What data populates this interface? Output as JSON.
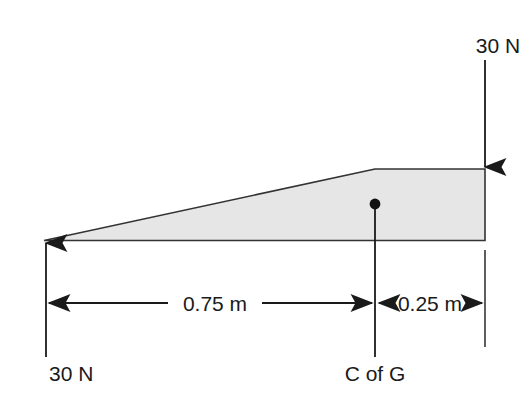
{
  "diagram": {
    "type": "free-body-diagram",
    "background_color": "#ffffff",
    "line_color": "#333333",
    "body": {
      "name": "tapered-wedge-beam",
      "fill_color": "#e6e6e6",
      "stroke_color": "#333333",
      "profile_points": "44,240 375,169 485,169 485,240"
    },
    "forces": [
      {
        "id": "left-force",
        "label": "30 N",
        "magnitude": 30,
        "unit": "N",
        "direction": "up",
        "location": "left end of beam"
      },
      {
        "id": "right-force",
        "label": "30 N",
        "magnitude": 30,
        "unit": "N",
        "direction": "down",
        "location": "right end of beam"
      }
    ],
    "dimensions": [
      {
        "id": "dim-left",
        "label": "0.75 m",
        "value": 0.75,
        "unit": "m",
        "from": "left end",
        "to": "C of G"
      },
      {
        "id": "dim-right",
        "label": "0.25 m",
        "value": 0.25,
        "unit": "m",
        "from": "C of G",
        "to": "right end"
      }
    ],
    "markers": [
      {
        "id": "centre-of-gravity",
        "label": "C of G",
        "symbol": "filled-dot"
      }
    ]
  }
}
